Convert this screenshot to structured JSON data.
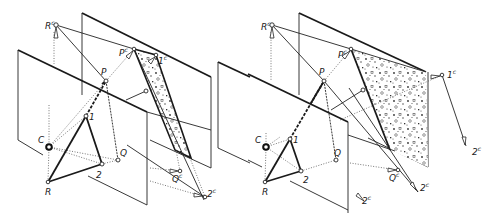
{
  "figure": {
    "colors": {
      "line": "#1a1a1a",
      "background": "#ffffff",
      "shading_dots": "#333333"
    }
  },
  "left_diagram": {
    "labels": {
      "Rc": "R",
      "Rc_sup": "c",
      "P": "P",
      "Pc": "P",
      "Pc_sup": "c",
      "onec": "1",
      "onec_sup": "c",
      "one": "1",
      "two": "2",
      "Q": "Q",
      "C": "C",
      "R": "R",
      "Qc": "Q",
      "Qc_sup": "c",
      "twoc": "2",
      "twoc_sup": "c"
    }
  },
  "right_diagram": {
    "labels": {
      "Rc": "R",
      "Rc_sup": "c",
      "P": "P",
      "Pc": "P",
      "Pc_sup": "c",
      "onec": "1",
      "onec_sup": "c",
      "twoc_far": "2",
      "twoc_far_sup": "c",
      "one": "1",
      "two": "2",
      "Q": "Q",
      "C": "C",
      "R": "R",
      "Qc": "Q",
      "Qc_sup": "c",
      "twoc": "2",
      "twoc_sup": "c",
      "twoc_low": "2",
      "twoc_low_sup": "c"
    }
  }
}
